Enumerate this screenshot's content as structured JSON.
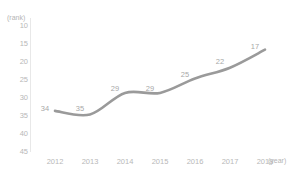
{
  "chart_data": {
    "type": "line",
    "title": "",
    "subtitle": "",
    "xlabel": "(year)",
    "ylabel": "(rank)",
    "categories": [
      "2012",
      "2013",
      "2014",
      "2015",
      "2016",
      "2017",
      "2018"
    ],
    "x": [
      2012,
      2013,
      2014,
      2015,
      2016,
      2017,
      2018
    ],
    "values": [
      34,
      35,
      29,
      29,
      25,
      22,
      17
    ],
    "series": [
      {
        "name": "rank",
        "values": [
          34,
          35,
          29,
          29,
          25,
          22,
          17
        ],
        "color": "#9a9a9a"
      }
    ],
    "data_labels": [
      "34",
      "35",
      "29",
      "29",
      "25",
      "22",
      "17"
    ],
    "ylim": [
      10,
      45
    ],
    "y_inverted": true,
    "y_ticks": [
      10,
      15,
      20,
      25,
      30,
      35,
      40,
      45
    ],
    "y_tick_labels": [
      "10",
      "15",
      "20",
      "25",
      "30",
      "35",
      "40",
      "45"
    ],
    "x_ticks": [
      2012,
      2013,
      2014,
      2015,
      2016,
      2017,
      2018
    ],
    "x_tick_labels": [
      "2012",
      "2013",
      "2014",
      "2015",
      "2016",
      "2017",
      "2018"
    ],
    "grid": false,
    "legend": null,
    "legend_position": "none",
    "line_style": "smooth",
    "markers": false,
    "background_color": "#ffffff",
    "axis_color": "#e4e4e4",
    "tick_label_color": "#b8b8b8",
    "data_label_color": "#a8a8a8"
  }
}
